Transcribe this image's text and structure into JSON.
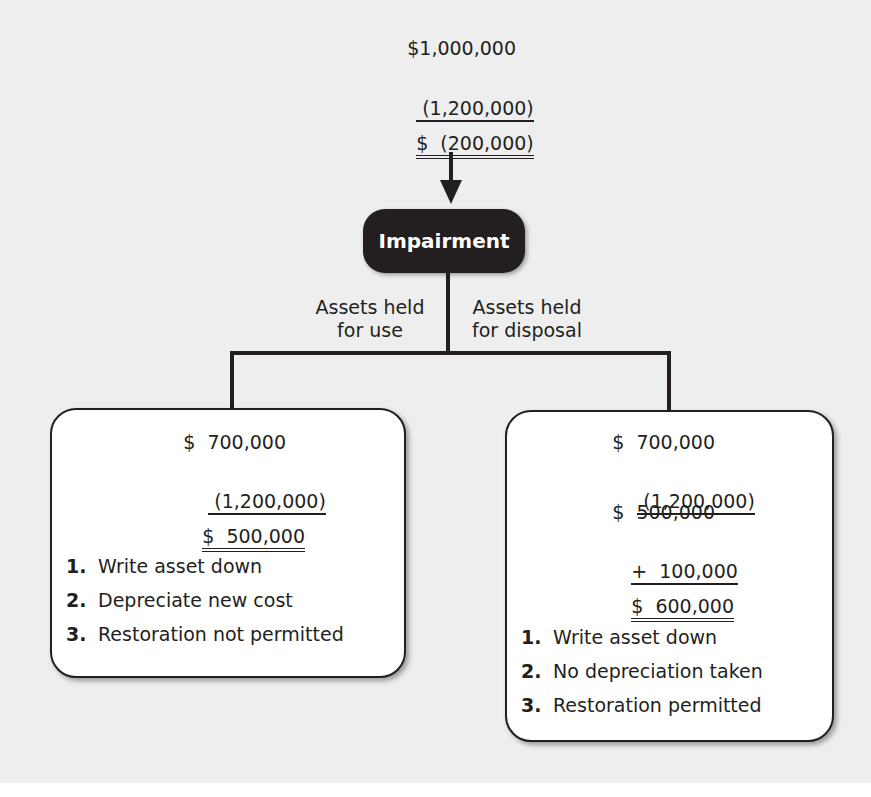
{
  "top_calc": {
    "line1": "$1,000,000",
    "line2": " (1,200,000)",
    "line3": "$  (200,000)"
  },
  "center_node": {
    "label": "Impairment"
  },
  "branches": {
    "left_label_line1": "Assets held",
    "left_label_line2": "for use",
    "right_label_line1": "Assets held",
    "right_label_line2": "for disposal"
  },
  "left_box": {
    "calc": {
      "line1": "$  700,000",
      "line2": " (1,200,000)",
      "line3": "$  500,000"
    },
    "steps": [
      {
        "num": "1.",
        "text": "Write asset down"
      },
      {
        "num": "2.",
        "text": "Depreciate new cost"
      },
      {
        "num": "3.",
        "text": "Restoration not permitted"
      }
    ]
  },
  "right_box": {
    "calc": {
      "line1": "$  700,000",
      "line2": " (1,200,000)",
      "line3": "$  500,000",
      "line4": "+  100,000",
      "line5": "$  600,000"
    },
    "steps": [
      {
        "num": "1.",
        "text": "Write asset down"
      },
      {
        "num": "2.",
        "text": "No depreciation taken"
      },
      {
        "num": "3.",
        "text": "Restoration permitted"
      }
    ]
  },
  "colors": {
    "ink": "#231f20",
    "background": "#eeeeee",
    "box_fill": "#ffffff"
  }
}
